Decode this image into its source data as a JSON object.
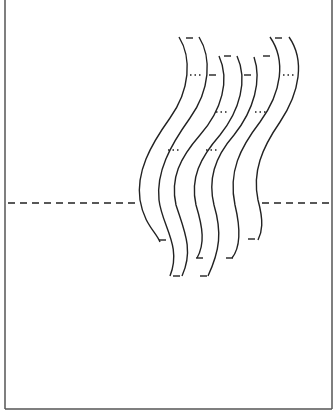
{
  "diagram": {
    "type": "pop-up card template",
    "colors": {
      "line": "#222222",
      "background": "#ffffff",
      "border": "#555555"
    },
    "fold_line": {
      "style": "dashed",
      "y": 203
    },
    "strips": [
      {
        "id": "strip-1",
        "cut_lines": 2,
        "fold_marks": "dotted",
        "position": "left"
      },
      {
        "id": "strip-2",
        "cut_lines": 2,
        "fold_marks": "dotted",
        "position": "center-left"
      },
      {
        "id": "strip-3",
        "cut_lines": 2,
        "fold_marks": "dotted",
        "position": "center-right"
      },
      {
        "id": "strip-4",
        "cut_lines": 2,
        "fold_marks": "dotted",
        "position": "right"
      }
    ]
  }
}
